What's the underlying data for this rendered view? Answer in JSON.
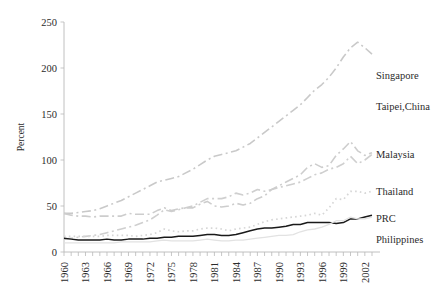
{
  "chart_data": {
    "type": "line",
    "title": "",
    "xlabel": "",
    "ylabel": "Percent",
    "xlim": [
      1960,
      2003
    ],
    "ylim": [
      0,
      250
    ],
    "grid": false,
    "legend_position": "right-inline-labels",
    "yticks": [
      0,
      50,
      100,
      150,
      200,
      250
    ],
    "xticks": [
      1960,
      1963,
      1966,
      1969,
      1972,
      1975,
      1978,
      1981,
      1984,
      1987,
      1990,
      1993,
      1996,
      1999,
      2002
    ],
    "x": [
      1960,
      1961,
      1962,
      1963,
      1964,
      1965,
      1966,
      1967,
      1968,
      1969,
      1970,
      1971,
      1972,
      1973,
      1974,
      1975,
      1976,
      1977,
      1978,
      1979,
      1980,
      1981,
      1982,
      1983,
      1984,
      1985,
      1986,
      1987,
      1988,
      1989,
      1990,
      1991,
      1992,
      1993,
      1994,
      1995,
      1996,
      1997,
      1998,
      1999,
      2000,
      2001,
      2002,
      2003
    ],
    "series": [
      {
        "name": "Singapore",
        "color": "#c9c9c9",
        "dash": "dashdot",
        "width": 1.6,
        "label_x": 2001,
        "label_y": 192,
        "values": [
          42,
          42,
          43,
          44,
          45,
          47,
          50,
          53,
          56,
          60,
          64,
          68,
          72,
          76,
          78,
          80,
          82,
          86,
          90,
          95,
          100,
          104,
          106,
          108,
          110,
          114,
          118,
          124,
          130,
          136,
          142,
          148,
          154,
          160,
          168,
          176,
          182,
          190,
          200,
          212,
          222,
          228,
          222,
          215
        ]
      },
      {
        "name": "Taipei,China",
        "color": "#cfcfcf",
        "dash": "dashdot",
        "width": 1.6,
        "label_x": 2001,
        "label_y": 158,
        "values": [
          14,
          15,
          16,
          17,
          18,
          19,
          21,
          23,
          25,
          27,
          29,
          32,
          35,
          40,
          46,
          44,
          46,
          48,
          50,
          54,
          58,
          58,
          58,
          60,
          64,
          62,
          64,
          68,
          66,
          68,
          70,
          72,
          74,
          76,
          80,
          84,
          86,
          90,
          92,
          96,
          104,
          96,
          100,
          106
        ]
      },
      {
        "name": "Malaysia",
        "color": "#cdcdcd",
        "dash": "dashdot",
        "width": 1.6,
        "label_x": 2001,
        "label_y": 106,
        "values": [
          42,
          40,
          39,
          39,
          38,
          39,
          39,
          39,
          39,
          42,
          41,
          41,
          41,
          45,
          48,
          45,
          47,
          48,
          48,
          52,
          55,
          50,
          49,
          50,
          53,
          51,
          53,
          58,
          61,
          68,
          72,
          76,
          80,
          84,
          92,
          96,
          92,
          94,
          105,
          112,
          120,
          110,
          105,
          108
        ]
      },
      {
        "name": "Thailand",
        "color": "#d6d6d6",
        "dash": "dotted",
        "width": 1.7,
        "label_x": 2001,
        "label_y": 66,
        "values": [
          17,
          17,
          17,
          17,
          17,
          17,
          18,
          18,
          18,
          18,
          17,
          18,
          19,
          21,
          25,
          23,
          22,
          23,
          23,
          25,
          26,
          26,
          25,
          23,
          25,
          26,
          27,
          30,
          33,
          35,
          36,
          37,
          38,
          39,
          40,
          42,
          40,
          48,
          58,
          57,
          66,
          66,
          64,
          66
        ]
      },
      {
        "name": "PRC",
        "color": "#1a1a1a",
        "dash": "solid",
        "width": 1.5,
        "label_x": 2001,
        "label_y": 37,
        "values": [
          15,
          14,
          13,
          13,
          13,
          13,
          14,
          13,
          13,
          14,
          14,
          14,
          15,
          15,
          16,
          16,
          17,
          17,
          17,
          18,
          19,
          19,
          18,
          18,
          19,
          21,
          23,
          25,
          26,
          26,
          27,
          28,
          30,
          30,
          32,
          32,
          32,
          32,
          31,
          32,
          36,
          36,
          38,
          40
        ]
      },
      {
        "name": "Philippines",
        "color": "#e2e2e2",
        "dash": "solid",
        "width": 1.3,
        "label_x": 2001,
        "label_y": 14,
        "values": [
          10,
          10,
          10,
          10,
          10,
          10,
          10,
          10,
          11,
          11,
          11,
          11,
          11,
          12,
          13,
          12,
          12,
          12,
          12,
          13,
          14,
          13,
          12,
          12,
          13,
          13,
          14,
          15,
          16,
          17,
          18,
          18,
          19,
          22,
          24,
          25,
          27,
          30,
          34,
          34,
          38,
          36,
          36,
          38
        ]
      }
    ]
  }
}
